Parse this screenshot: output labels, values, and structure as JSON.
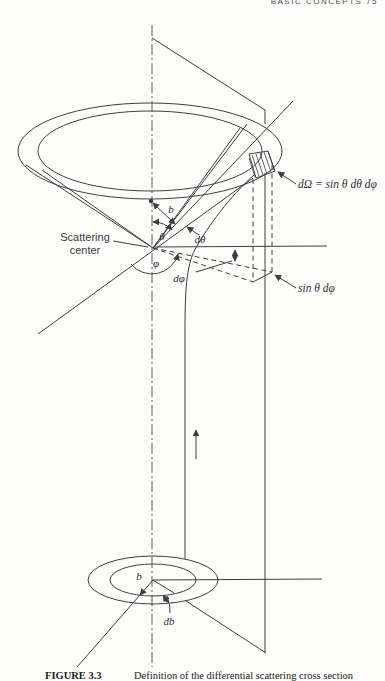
{
  "page_header": {
    "text": "BASIC CONCEPTS 75"
  },
  "diagram": {
    "labels": {
      "solid_angle": "dΩ = sin θ dθ dφ",
      "ring_arc_width": "sin θ dφ",
      "scattering_center_line1": "Scattering",
      "scattering_center_line2": "center",
      "impact_parameter_top": "b",
      "theta": "θ",
      "d_theta": "dθ",
      "phi": "φ",
      "d_phi": "dφ",
      "impact_parameter_bottom": "b",
      "d_impact_parameter": "db"
    },
    "colors": {
      "line": "#3f3f3f",
      "text": "#2e2e2e",
      "background": "#fdfdfc"
    }
  },
  "caption": {
    "figure_tag": "FIGURE 3.3",
    "text": "Definition of the differential scattering cross section"
  }
}
